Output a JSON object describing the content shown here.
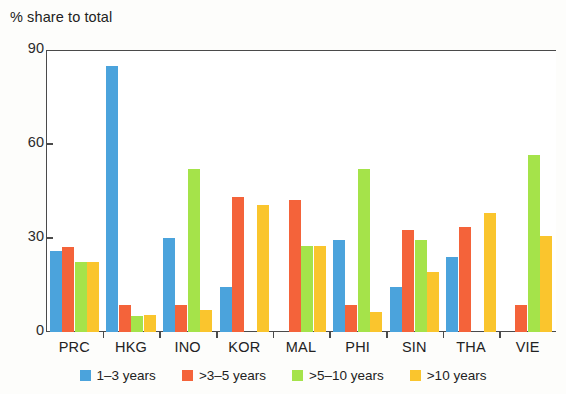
{
  "chart_data": {
    "type": "bar",
    "title": "% share to total",
    "xlabel": "",
    "ylabel": "",
    "ylim": [
      0,
      90
    ],
    "yticks": [
      0,
      30,
      60,
      90
    ],
    "grid": false,
    "legend_position": "bottom",
    "categories": [
      "PRC",
      "HKG",
      "INO",
      "KOR",
      "MAL",
      "PHI",
      "SIN",
      "THA",
      "VIE"
    ],
    "series": [
      {
        "name": "1–3 years",
        "color": "#4ba3dc",
        "values": [
          26,
          85,
          30,
          14.5,
          0,
          29.5,
          14.5,
          24,
          0
        ]
      },
      {
        "name": ">3–5 years",
        "color": "#f4633a",
        "values": [
          27,
          8.5,
          8.5,
          43,
          42,
          8.5,
          32.5,
          33.5,
          8.5
        ]
      },
      {
        "name": ">5–10 years",
        "color": "#a5e34a",
        "values": [
          22.5,
          5,
          52,
          0,
          27.5,
          52,
          29.5,
          0,
          56.5
        ]
      },
      {
        "name": ">10 years",
        "color": "#fac52d",
        "values": [
          22.5,
          5.5,
          7,
          40.5,
          27.5,
          6.5,
          19,
          38,
          30.5
        ]
      }
    ]
  },
  "axes": {
    "y_tick_labels": [
      "0",
      "30",
      "60",
      "90"
    ]
  },
  "legend": {
    "items": [
      {
        "label": "1–3 years",
        "color": "#4ba3dc"
      },
      {
        "label": ">3–5 years",
        "color": "#f4633a"
      },
      {
        "label": ">5–10 years",
        "color": "#a5e34a"
      },
      {
        "label": ">10 years",
        "color": "#fac52d"
      }
    ]
  }
}
